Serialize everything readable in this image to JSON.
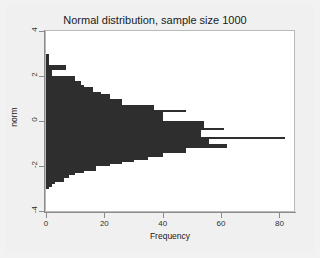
{
  "chart_data": {
    "type": "bar",
    "orientation": "horizontal",
    "title": "Normal distribution, sample size 1000",
    "xlabel": "Frequency",
    "ylabel": "norm",
    "xlim": [
      0,
      85
    ],
    "ylim": [
      -4,
      4
    ],
    "xticks": [
      0,
      20,
      40,
      60,
      80
    ],
    "xtick_labels": [
      "0",
      "20",
      "40",
      "60",
      "80"
    ],
    "yticks": [
      4,
      2,
      0,
      -2,
      -4
    ],
    "ytick_labels": [
      "4",
      "2",
      "0",
      "-2",
      "-4"
    ],
    "grid": false,
    "legend": null,
    "bar_color": "#2e2e2e",
    "plot_bgcolor": "#ffffff",
    "figure_bgcolor": "#f0f0f0",
    "n": 1000,
    "bin_width": 0.1,
    "categories": [
      2.95,
      2.85,
      2.75,
      2.65,
      2.55,
      2.45,
      2.35,
      2.25,
      2.15,
      2.05,
      1.95,
      1.85,
      1.75,
      1.65,
      1.55,
      1.45,
      1.35,
      1.25,
      1.15,
      1.05,
      0.95,
      0.85,
      0.75,
      0.65,
      0.55,
      0.45,
      0.35,
      0.25,
      0.15,
      0.05,
      -0.05,
      -0.15,
      -0.25,
      -0.35,
      -0.45,
      -0.55,
      -0.65,
      -0.75,
      -0.85,
      -0.95,
      -1.05,
      -1.15,
      -1.25,
      -1.35,
      -1.45,
      -1.55,
      -1.65,
      -1.75,
      -1.85,
      -1.95,
      -2.05,
      -2.15,
      -2.25,
      -2.35,
      -2.45,
      -2.55,
      -2.65,
      -2.75,
      -2.85,
      -2.95
    ],
    "values": [
      1,
      1,
      1,
      1,
      1,
      7,
      7,
      2,
      2,
      2,
      10,
      10,
      12,
      12,
      13,
      16,
      16,
      19,
      22,
      22,
      26,
      26,
      26,
      37,
      37,
      48,
      40,
      40,
      40,
      40,
      54,
      54,
      54,
      61,
      53,
      53,
      53,
      82,
      56,
      56,
      62,
      62,
      48,
      48,
      40,
      40,
      35,
      30,
      26,
      22,
      17,
      17,
      13,
      10,
      8,
      6,
      6,
      3,
      2,
      1
    ],
    "max_value": 82,
    "max_value_category": -0.75
  },
  "axes": {
    "y_title": "norm",
    "x_title": "Frequency"
  }
}
